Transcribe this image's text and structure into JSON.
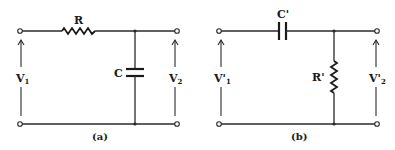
{
  "panels": [
    {
      "id": "a",
      "caption": "(a)",
      "series_label": "R",
      "shunt_label": "C",
      "input_voltage": {
        "main": "V",
        "sub": "1"
      },
      "output_voltage": {
        "main": "V",
        "sub": "2"
      }
    },
    {
      "id": "b",
      "caption": "(b)",
      "series_label": "C'",
      "shunt_label": "R'",
      "input_voltage": {
        "main": "V'",
        "sub": "1"
      },
      "output_voltage": {
        "main": "V'",
        "sub": "2"
      }
    }
  ]
}
